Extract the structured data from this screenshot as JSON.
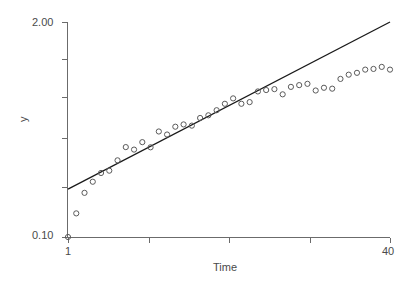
{
  "chart_data": {
    "type": "scatter",
    "title": "",
    "subtitle": "",
    "xlabel": "Time",
    "ylabel": "y",
    "yscale": "log",
    "xscale": "linear",
    "grid": false,
    "legend": "none",
    "xlim": [
      1,
      40
    ],
    "ylim": [
      0.1,
      2.0
    ],
    "xticks": [
      1,
      40
    ],
    "xtick_labels": [
      "1",
      "40"
    ],
    "yticks": [
      0.1,
      2.0
    ],
    "ytick_labels": [
      "0.10",
      "2.00"
    ],
    "series": [
      {
        "name": "observed",
        "type": "scatter",
        "marker": "open-circle",
        "color": "#5a5a5a",
        "x": [
          1,
          2,
          3,
          4,
          5,
          6,
          7,
          8,
          9,
          10,
          11,
          12,
          13,
          14,
          15,
          16,
          17,
          18,
          19,
          20,
          21,
          22,
          23,
          24,
          25,
          26,
          27,
          28,
          29,
          30,
          31,
          32,
          33,
          34,
          35,
          36,
          37,
          38,
          39,
          40
        ],
        "y": [
          0.1,
          0.139,
          0.185,
          0.216,
          0.244,
          0.252,
          0.291,
          0.35,
          0.338,
          0.375,
          0.349,
          0.435,
          0.417,
          0.465,
          0.48,
          0.472,
          0.525,
          0.545,
          0.585,
          0.64,
          0.69,
          0.64,
          0.655,
          0.76,
          0.775,
          0.785,
          0.73,
          0.81,
          0.83,
          0.845,
          0.77,
          0.8,
          0.79,
          0.905,
          0.96,
          0.985,
          1.03,
          1.04,
          1.07,
          1.03
        ]
      },
      {
        "name": "fitted-line",
        "type": "line",
        "color": "#1a1a1a",
        "x": [
          1,
          40
        ],
        "y": [
          0.195,
          2.0
        ]
      }
    ]
  },
  "axes": {
    "y_title": "y",
    "x_title": "Time",
    "y_top_label": "2.00",
    "y_bottom_label": "0.10",
    "x_left_label": "1",
    "x_right_label": "40"
  },
  "colors": {
    "axis": "#6b6b6b",
    "marker": "#5a5a5a",
    "line": "#1a1a1a",
    "text": "#4a4a4a",
    "background": "#ffffff"
  }
}
